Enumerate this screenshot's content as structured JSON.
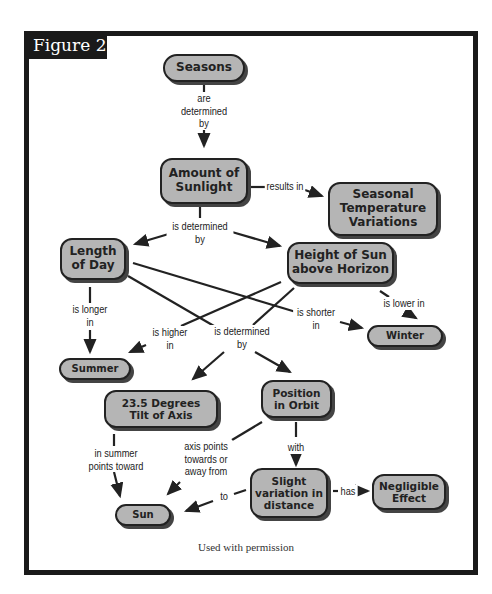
{
  "figure": {
    "label": "Figure 2",
    "caption": "Used with permission"
  },
  "nodes": {
    "seasons": "Seasons",
    "amount_of_sunlight": "Amount of Sunlight",
    "seasonal_temperature_variations": "Seasonal Temperature Variations",
    "length_of_day": "Length of Day",
    "height_of_sun": "Height of Sun above Horizon",
    "winter": "Winter",
    "summer": "Summer",
    "tilt_of_axis": "23.5 Degrees Tilt of Axis",
    "position_in_orbit": "Position in Orbit",
    "slight_variation": "Slight variation in distance",
    "negligible_effect": "Negligible Effect",
    "sun": "Sun"
  },
  "links": {
    "are_determined_by": "are\ndetermined\nby",
    "results_in": "results in",
    "is_determined_by_1": "is determined\nby",
    "is_longer_in": "is longer\nin",
    "is_shorter_in": "is shorter\nin",
    "is_lower_in": "is lower in",
    "is_higher_in": "is higher\nin",
    "is_determined_by_2": "is determined\nby",
    "in_summer_points_toward": "in summer\npoints toward",
    "axis_points": "axis points\ntowards or\naway from",
    "with": "with",
    "to": "to",
    "has": "has"
  },
  "colors": {
    "node_fill": "#b5b5b5",
    "frame": "#1a1a1a",
    "line": "#222222"
  }
}
